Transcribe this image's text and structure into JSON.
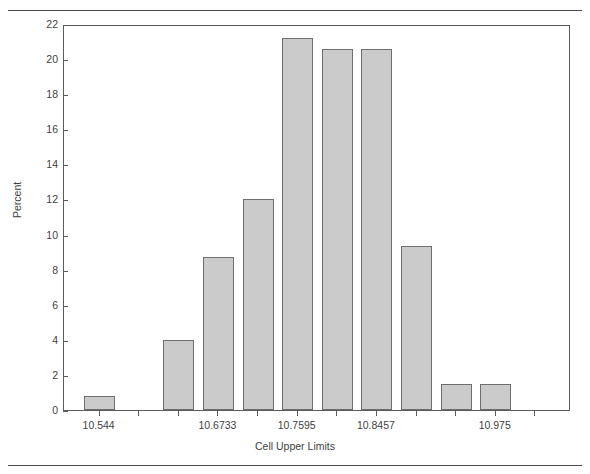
{
  "figure": {
    "clipped_header_text": "",
    "rules": [
      "top-rule",
      "bottom-rule"
    ]
  },
  "chart_data": {
    "type": "bar",
    "title": "",
    "xlabel": "Cell Upper Limits",
    "ylabel": "Percent",
    "ylim": [
      0,
      22
    ],
    "ytick_values": [
      0,
      2,
      4,
      6,
      8,
      10,
      12,
      14,
      16,
      18,
      20,
      22
    ],
    "ytick_labels": [
      "0",
      "2",
      "4",
      "6",
      "8",
      "10",
      "12",
      "14",
      "16",
      "18",
      "20",
      "22"
    ],
    "grid": false,
    "legend": null,
    "bar_color": "#cbcbcb",
    "bar_edge_color": "#6e6e6e",
    "n_bins": 12,
    "categories": [
      "10.544",
      "10.5871",
      "10.6302",
      "10.6733",
      "10.7164",
      "10.7595",
      "10.8026",
      "10.8457",
      "10.8888",
      "10.9319",
      "10.975",
      "11.0181"
    ],
    "values": [
      0.8,
      0,
      4.0,
      8.7,
      12.0,
      21.2,
      20.6,
      20.6,
      9.35,
      1.5,
      1.5,
      0
    ],
    "xtick_labeled": [
      {
        "index": 0,
        "label": "10.544"
      },
      {
        "index": 3,
        "label": "10.6733"
      },
      {
        "index": 5,
        "label": "10.7595"
      },
      {
        "index": 7,
        "label": "10.8457"
      },
      {
        "index": 10,
        "label": "10.975"
      }
    ]
  }
}
